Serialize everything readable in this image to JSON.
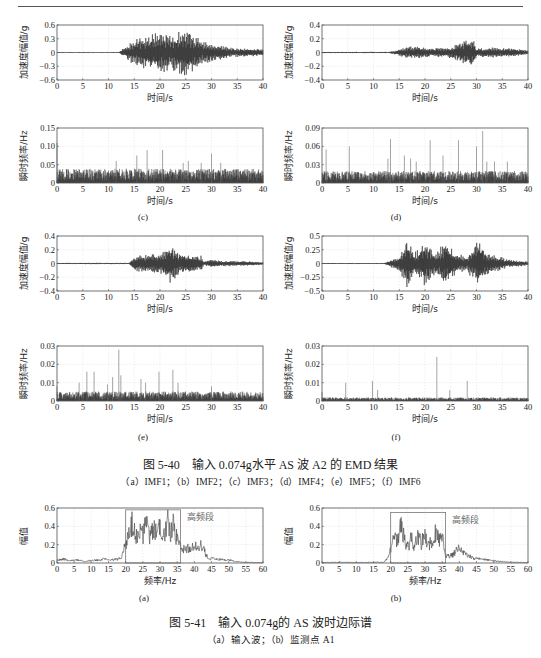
{
  "header": {
    "text": "第5章 地铁车站结构振动台试验结果及分析"
  },
  "figure_540": {
    "title": "图 5-40　输入 0.074g水平 AS 波 A2 的 EMD 结果",
    "subcaption": "（a）IMF1；（b）IMF2；（c）IMF3；（d）IMF4；（e）IMF5；（f）IMF6",
    "panel_labels": [
      "(c)",
      "(d)",
      "(e)",
      "(f)"
    ],
    "axis": {
      "time_label": "时间/s",
      "accel_label": "加速度幅值/g",
      "freq_label": "瞬时频率/Hz"
    }
  },
  "figure_541": {
    "title": "图 5-41　输入 0.074g的 AS 波时边际谱",
    "subcaption": "（a）输入波；（b）监测点 A1",
    "panel_labels": [
      "(a)",
      "(b)"
    ],
    "axis": {
      "xlabel": "频率/Hz",
      "ylabel": "幅值"
    },
    "annotation": "高频段"
  },
  "chart_data": [
    {
      "id": "c-accel",
      "type": "line",
      "title": "",
      "xlabel": "时间/s",
      "ylabel": "加速度幅值/g",
      "xlim": [
        0,
        40
      ],
      "ylim": [
        -0.6,
        0.6
      ],
      "xticks": [
        0,
        5,
        10,
        15,
        20,
        25,
        30,
        35,
        40
      ],
      "yticks": [
        0.6,
        0.3,
        0,
        -0.3,
        -0.6
      ],
      "yticklabels": [
        "0.6",
        "0.3",
        "0",
        "−0.3",
        "−0.6"
      ],
      "grid": true,
      "envelope": {
        "x": [
          0,
          12,
          13,
          15,
          20,
          22,
          25,
          27,
          30,
          35,
          40
        ],
        "amp": [
          0.01,
          0.01,
          0.1,
          0.3,
          0.45,
          0.4,
          0.55,
          0.35,
          0.2,
          0.1,
          0.08
        ]
      }
    },
    {
      "id": "d-accel",
      "type": "line",
      "title": "",
      "xlabel": "时间/s",
      "ylabel": "加速度幅值/g",
      "xlim": [
        0,
        40
      ],
      "ylim": [
        -0.4,
        0.4
      ],
      "xticks": [
        0,
        5,
        10,
        15,
        20,
        25,
        30,
        35,
        40
      ],
      "yticks": [
        0.4,
        0.2,
        0,
        -0.2,
        -0.4
      ],
      "yticklabels": [
        "0.4",
        "0.2",
        "0",
        "−0.2",
        "−0.4"
      ],
      "grid": true,
      "envelope": {
        "x": [
          0,
          13,
          15,
          17,
          20,
          25,
          29,
          30,
          33,
          37,
          40
        ],
        "amp": [
          0.01,
          0.01,
          0.05,
          0.1,
          0.07,
          0.08,
          0.25,
          0.06,
          0.08,
          0.06,
          0.03
        ]
      }
    },
    {
      "id": "c-freq",
      "type": "line",
      "title": "",
      "xlabel": "时间/s",
      "ylabel": "瞬时频率/Hz",
      "xlim": [
        0,
        40
      ],
      "ylim": [
        0,
        0.15
      ],
      "xticks": [
        0,
        5,
        10,
        15,
        20,
        25,
        30,
        35,
        40
      ],
      "yticks": [
        0.15,
        0.1,
        0.05,
        0
      ],
      "yticklabels": [
        "0.15",
        "0.10",
        "0.05",
        "0"
      ],
      "grid": true,
      "baseline": 0.03,
      "spikes": [
        [
          0,
          0.11
        ],
        [
          11.5,
          0.06
        ],
        [
          15.5,
          0.075
        ],
        [
          17.5,
          0.09
        ],
        [
          20.5,
          0.09
        ],
        [
          24.5,
          0.055
        ],
        [
          25.5,
          0.06
        ],
        [
          28,
          0.055
        ],
        [
          30,
          0.08
        ],
        [
          31.8,
          0.055
        ]
      ]
    },
    {
      "id": "d-freq",
      "type": "line",
      "title": "",
      "xlabel": "时间/s",
      "ylabel": "瞬时频率/Hz",
      "xlim": [
        0,
        40
      ],
      "ylim": [
        0,
        0.09
      ],
      "xticks": [
        0,
        5,
        10,
        15,
        20,
        25,
        30,
        35,
        40
      ],
      "yticks": [
        0.09,
        0.06,
        0.03,
        0
      ],
      "yticklabels": [
        "0.09",
        "0.06",
        "0.03",
        "0"
      ],
      "grid": true,
      "baseline": 0.015,
      "spikes": [
        [
          0.8,
          0.055
        ],
        [
          5.3,
          0.06
        ],
        [
          12.8,
          0.04
        ],
        [
          13.3,
          0.072
        ],
        [
          16,
          0.045
        ],
        [
          17.2,
          0.04
        ],
        [
          18.3,
          0.035
        ],
        [
          21,
          0.07
        ],
        [
          23.5,
          0.045
        ],
        [
          26.5,
          0.07
        ],
        [
          30,
          0.06
        ],
        [
          31.2,
          0.085
        ],
        [
          32,
          0.035
        ],
        [
          33.5,
          0.035
        ],
        [
          36,
          0.035
        ]
      ]
    },
    {
      "id": "e-accel",
      "type": "line",
      "title": "",
      "xlabel": "时间/s",
      "ylabel": "加速度幅值/g",
      "xlim": [
        0,
        40
      ],
      "ylim": [
        -0.4,
        0.4
      ],
      "xticks": [
        0,
        5,
        10,
        15,
        20,
        25,
        30,
        35,
        40
      ],
      "yticks": [
        0.4,
        0.2,
        0,
        -0.2,
        -0.4
      ],
      "yticklabels": [
        "0.4",
        "0.2",
        "0",
        "−0.2",
        "−0.4"
      ],
      "grid": true,
      "envelope": {
        "x": [
          0,
          14,
          15,
          18,
          20,
          22,
          24,
          26,
          28,
          28.5,
          30,
          32,
          35,
          40
        ],
        "amp": [
          0.01,
          0.01,
          0.12,
          0.14,
          0.15,
          0.3,
          0.15,
          0.14,
          0.12,
          0.03,
          0.06,
          0.04,
          0.04,
          0.02
        ]
      }
    },
    {
      "id": "f-accel",
      "type": "line",
      "title": "",
      "xlabel": "时间/s",
      "ylabel": "加速度幅值/g",
      "xlim": [
        0,
        40
      ],
      "ylim": [
        -0.5,
        0.5
      ],
      "xticks": [
        0,
        5,
        10,
        15,
        20,
        25,
        30,
        35,
        40
      ],
      "yticks": [
        0.5,
        0.25,
        0,
        -0.25,
        -0.5
      ],
      "yticklabels": [
        "0.5",
        "0.25",
        "0",
        "−0.25",
        "−0.5"
      ],
      "grid": true,
      "envelope": {
        "x": [
          0,
          12,
          13,
          15,
          16.5,
          18,
          20,
          22,
          24,
          26,
          28,
          30.5,
          32,
          34,
          36,
          40
        ],
        "amp": [
          0.01,
          0.01,
          0.05,
          0.15,
          0.45,
          0.2,
          0.42,
          0.2,
          0.4,
          0.2,
          0.15,
          0.45,
          0.2,
          0.15,
          0.08,
          0.04
        ]
      }
    },
    {
      "id": "e-freq",
      "type": "line",
      "title": "",
      "xlabel": "时间/s",
      "ylabel": "瞬时频率/Hz",
      "xlim": [
        0,
        40
      ],
      "ylim": [
        0,
        0.03
      ],
      "xticks": [
        0,
        5,
        10,
        15,
        20,
        25,
        30,
        35,
        40
      ],
      "yticks": [
        0.03,
        0.02,
        0.01,
        0
      ],
      "yticklabels": [
        "0.03",
        "0.02",
        "0.01",
        "0"
      ],
      "grid": true,
      "baseline": 0.004,
      "spikes": [
        [
          0,
          0.008
        ],
        [
          4.3,
          0.01
        ],
        [
          5.8,
          0.016
        ],
        [
          7.2,
          0.016
        ],
        [
          9.8,
          0.009
        ],
        [
          10.8,
          0.013
        ],
        [
          12,
          0.028
        ],
        [
          12.4,
          0.014
        ],
        [
          16.3,
          0.012
        ],
        [
          17.2,
          0.01
        ],
        [
          19.8,
          0.016
        ],
        [
          22.5,
          0.017
        ],
        [
          23.5,
          0.01
        ],
        [
          30,
          0.008
        ]
      ]
    },
    {
      "id": "f-freq",
      "type": "line",
      "title": "",
      "xlabel": "时间/s",
      "ylabel": "瞬时频率/Hz",
      "xlim": [
        0,
        40
      ],
      "ylim": [
        0,
        0.03
      ],
      "xticks": [
        0,
        5,
        10,
        15,
        20,
        25,
        30,
        35,
        40
      ],
      "yticks": [
        0.03,
        0.02,
        0.01,
        0
      ],
      "yticklabels": [
        "0.03",
        "0.02",
        "0.01",
        "0"
      ],
      "grid": true,
      "baseline": 0.0015,
      "spikes": [
        [
          0,
          0.005
        ],
        [
          4.6,
          0.01
        ],
        [
          9.8,
          0.011
        ],
        [
          10.8,
          0.006
        ],
        [
          22.3,
          0.024
        ],
        [
          24.8,
          0.006
        ],
        [
          28.2,
          0.011
        ]
      ]
    },
    {
      "id": "a-spectrum",
      "type": "line",
      "title": "",
      "xlabel": "频率/Hz",
      "ylabel": "幅值",
      "xlim": [
        0,
        60
      ],
      "ylim": [
        0,
        0.6
      ],
      "xticks": [
        0,
        5,
        10,
        15,
        20,
        25,
        30,
        35,
        40,
        45,
        50,
        55,
        60
      ],
      "yticks": [
        0.6,
        0.4,
        0.2,
        0
      ],
      "yticklabels": [
        "0.6",
        "0.4",
        "0.2",
        "0"
      ],
      "grid": true,
      "highlight_box": {
        "x": [
          20,
          36
        ],
        "y": [
          0,
          0.58
        ],
        "label": "高频段"
      },
      "x": [
        0,
        2,
        4,
        6,
        8,
        10,
        12,
        14,
        16,
        18,
        19,
        20,
        21,
        22,
        23,
        24,
        25,
        26,
        27,
        28,
        29,
        30,
        31,
        32,
        33,
        34,
        35,
        36,
        38,
        40,
        42,
        43,
        44,
        46,
        48,
        50,
        52,
        54,
        56,
        58,
        60
      ],
      "values": [
        0.04,
        0.05,
        0.03,
        0.04,
        0.02,
        0.03,
        0.04,
        0.05,
        0.04,
        0.05,
        0.1,
        0.25,
        0.35,
        0.55,
        0.3,
        0.45,
        0.35,
        0.5,
        0.3,
        0.48,
        0.35,
        0.52,
        0.3,
        0.55,
        0.4,
        0.5,
        0.3,
        0.2,
        0.18,
        0.2,
        0.22,
        0.15,
        0.05,
        0.06,
        0.04,
        0.04,
        0.02,
        0.01,
        0.01,
        0.005,
        0.005
      ]
    },
    {
      "id": "b-spectrum",
      "type": "line",
      "title": "",
      "xlabel": "频率/Hz",
      "ylabel": "幅值",
      "xlim": [
        0,
        60
      ],
      "ylim": [
        0,
        0.6
      ],
      "xticks": [
        0,
        5,
        10,
        15,
        20,
        25,
        30,
        35,
        40,
        45,
        50,
        55,
        60
      ],
      "yticks": [
        0.6,
        0.4,
        0.2,
        0
      ],
      "yticklabels": [
        "0.6",
        "0.4",
        "0.2",
        "0"
      ],
      "grid": true,
      "highlight_box": {
        "x": [
          20,
          36
        ],
        "y": [
          0,
          0.55
        ],
        "label": "高频段"
      },
      "x": [
        0,
        5,
        10,
        15,
        18,
        19,
        20,
        21,
        22,
        23,
        24,
        25,
        26,
        27,
        28,
        29,
        30,
        31,
        32,
        33,
        34,
        35,
        36,
        38,
        40,
        42,
        44,
        46,
        48,
        50,
        52,
        55,
        60
      ],
      "values": [
        0.005,
        0.01,
        0.005,
        0.01,
        0.01,
        0.05,
        0.2,
        0.42,
        0.25,
        0.48,
        0.3,
        0.2,
        0.32,
        0.22,
        0.35,
        0.25,
        0.4,
        0.2,
        0.3,
        0.38,
        0.3,
        0.35,
        0.08,
        0.1,
        0.2,
        0.12,
        0.06,
        0.05,
        0.04,
        0.03,
        0.02,
        0.01,
        0.005
      ]
    }
  ]
}
